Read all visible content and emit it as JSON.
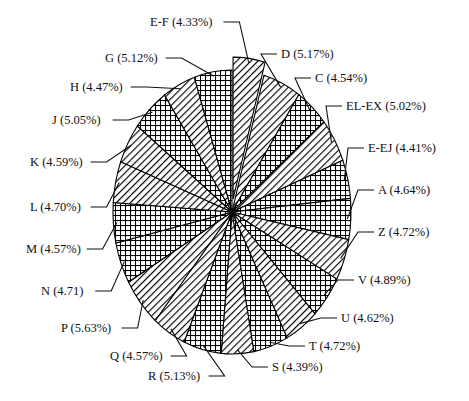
{
  "chart_data": {
    "type": "pie",
    "title": "",
    "xlabel": "",
    "ylabel": "",
    "legend_position": "none",
    "grid": false,
    "units": "percent",
    "label_format": "NAME (VALUE%)",
    "exploded_slice": "E-F",
    "start_angle_deg": -90,
    "direction": "clockwise",
    "categories": [
      "E-F",
      "D",
      "C",
      "EL-EX",
      "E-EJ",
      "A",
      "Z",
      "V",
      "U",
      "T",
      "S",
      "R",
      "Q",
      "P",
      "N",
      "M",
      "L",
      "K",
      "J",
      "H",
      "G"
    ],
    "values": [
      4.33,
      5.17,
      4.54,
      5.02,
      4.41,
      4.64,
      4.72,
      4.89,
      4.62,
      4.72,
      4.39,
      5.13,
      4.57,
      5.63,
      4.71,
      4.57,
      4.7,
      4.59,
      5.05,
      4.47,
      5.12
    ],
    "slices": [
      {
        "name": "E-F",
        "value": 4.33,
        "label": "E-F (4.33%)",
        "pattern": "diagonal"
      },
      {
        "name": "D",
        "value": 5.17,
        "label": "D (5.17%)",
        "pattern": "diagonal"
      },
      {
        "name": "C",
        "value": 4.54,
        "label": "C (4.54%)",
        "pattern": "crosshatch"
      },
      {
        "name": "EL-EX",
        "value": 5.02,
        "label": "EL-EX (5.02%)",
        "pattern": "diagonal"
      },
      {
        "name": "E-EJ",
        "value": 4.41,
        "label": "E-EJ (4.41%)",
        "pattern": "crosshatch"
      },
      {
        "name": "A",
        "value": 4.64,
        "label": "A (4.64%)",
        "pattern": "crosshatch"
      },
      {
        "name": "Z",
        "value": 4.72,
        "label": "Z (4.72%)",
        "pattern": "diagonal"
      },
      {
        "name": "V",
        "value": 4.89,
        "label": "V (4.89%)",
        "pattern": "crosshatch"
      },
      {
        "name": "U",
        "value": 4.62,
        "label": "U (4.62%)",
        "pattern": "diagonal"
      },
      {
        "name": "T",
        "value": 4.72,
        "label": "T (4.72%)",
        "pattern": "crosshatch"
      },
      {
        "name": "S",
        "value": 4.39,
        "label": "S (4.39%)",
        "pattern": "diagonal"
      },
      {
        "name": "R",
        "value": 5.13,
        "label": "R (5.13%)",
        "pattern": "crosshatch"
      },
      {
        "name": "Q",
        "value": 4.57,
        "label": "Q (4.57%)",
        "pattern": "diagonal"
      },
      {
        "name": "P",
        "value": 5.63,
        "label": "P (5.63%)",
        "pattern": "diagonal"
      },
      {
        "name": "N",
        "value": 4.71,
        "label": "N (4.71)",
        "pattern": "crosshatch"
      },
      {
        "name": "M",
        "value": 4.57,
        "label": "M (4.57%)",
        "pattern": "crosshatch"
      },
      {
        "name": "L",
        "value": 4.7,
        "label": "L (4.70%)",
        "pattern": "diagonal"
      },
      {
        "name": "K",
        "value": 4.59,
        "label": "K (4.59%)",
        "pattern": "diagonal"
      },
      {
        "name": "J",
        "value": 5.05,
        "label": "J (5.05%)",
        "pattern": "crosshatch"
      },
      {
        "name": "H",
        "value": 4.47,
        "label": "H (4.47%)",
        "pattern": "diagonal"
      },
      {
        "name": "G",
        "value": 5.12,
        "label": "G (5.12%)",
        "pattern": "crosshatch"
      }
    ]
  },
  "colors": {
    "background": "#ffffff",
    "stroke": "#000000",
    "text": "#111111",
    "fill_light": "#ffffff",
    "fill_hatch": "#000000"
  },
  "labels": {
    "E-F": {
      "text": "E-F (4.33%)",
      "x": 150,
      "y": 26,
      "anchor": "start"
    },
    "D": {
      "text": "D (5.17%)",
      "x": 281,
      "y": 58,
      "anchor": "start"
    },
    "C": {
      "text": "C (4.54%)",
      "x": 315,
      "y": 82,
      "anchor": "start"
    },
    "EL-EX": {
      "text": "EL-EX (5.02%)",
      "x": 346,
      "y": 110,
      "anchor": "start"
    },
    "E-EJ": {
      "text": "E-EJ (4.41%)",
      "x": 368,
      "y": 152,
      "anchor": "start"
    },
    "A": {
      "text": "A (4.64%)",
      "x": 378,
      "y": 194,
      "anchor": "start"
    },
    "Z": {
      "text": "Z (4.72%)",
      "x": 378,
      "y": 236,
      "anchor": "start"
    },
    "V": {
      "text": "V (4.89%)",
      "x": 358,
      "y": 284,
      "anchor": "start"
    },
    "U": {
      "text": "U (4.62%)",
      "x": 341,
      "y": 322,
      "anchor": "start"
    },
    "T": {
      "text": "T (4.72%)",
      "x": 309,
      "y": 350,
      "anchor": "start"
    },
    "S": {
      "text": "S (4.39%)",
      "x": 272,
      "y": 371,
      "anchor": "start"
    },
    "R": {
      "text": "R (5.13%)",
      "x": 148,
      "y": 380,
      "anchor": "start"
    },
    "Q": {
      "text": "Q (4.57%)",
      "x": 110,
      "y": 360,
      "anchor": "start"
    },
    "P": {
      "text": "P (5.63%)",
      "x": 61,
      "y": 332,
      "anchor": "start"
    },
    "N": {
      "text": "N (4.71)",
      "x": 41,
      "y": 295,
      "anchor": "start"
    },
    "M": {
      "text": "M (4.57%)",
      "x": 26,
      "y": 253,
      "anchor": "start"
    },
    "L": {
      "text": "L (4.70%)",
      "x": 30,
      "y": 211,
      "anchor": "start"
    },
    "K": {
      "text": "K (4.59%)",
      "x": 30,
      "y": 166,
      "anchor": "start"
    },
    "J": {
      "text": "J (5.05%)",
      "x": 52,
      "y": 124,
      "anchor": "start"
    },
    "H": {
      "text": "H (4.47%)",
      "x": 70,
      "y": 91,
      "anchor": "start"
    },
    "G": {
      "text": "G (5.12%)",
      "x": 105,
      "y": 62,
      "anchor": "start"
    }
  }
}
